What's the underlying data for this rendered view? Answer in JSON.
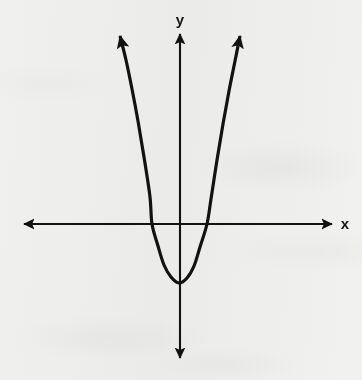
{
  "figure": {
    "kind": "cartesian-coordinate-plane",
    "title": "",
    "background_color": "#f7f7f6",
    "ink_color": "#121212",
    "width": 362,
    "height": 380
  },
  "axes": {
    "x_axis": {
      "label": "x",
      "label_x": 345,
      "label_y": 225,
      "line_y": 224,
      "start_x": 24,
      "end_x": 332,
      "arrowheads": "both",
      "stroke_width": 2.1
    },
    "y_axis": {
      "label": "y",
      "label_x": 180,
      "label_y": 19,
      "line_x": 180,
      "start_y": 34,
      "end_y": 358,
      "arrowheads": "both",
      "stroke_width": 2.1
    },
    "origin": {
      "x": 180,
      "y": 224
    },
    "grid": "off",
    "tick_labels": []
  },
  "chart_data": {
    "type": "line",
    "title": "",
    "xlabel": "x",
    "ylabel": "y",
    "grid": false,
    "legend": "none",
    "curve_name": "upward-opening parabola",
    "stroke_color": "#121212",
    "stroke_width": 3.2,
    "arrowheads": "both-ends-upward",
    "vertex_px": {
      "x": 179,
      "y": 283
    },
    "x_intercepts_px": [
      152,
      207
    ],
    "left_arm_tip_px": {
      "x": 120,
      "y": 30
    },
    "right_arm_tip_px": {
      "x": 240,
      "y": 30
    },
    "points_px": [
      {
        "x": 120,
        "y": 36
      },
      {
        "x": 126,
        "y": 60
      },
      {
        "x": 132,
        "y": 89
      },
      {
        "x": 138,
        "y": 121
      },
      {
        "x": 144,
        "y": 157
      },
      {
        "x": 150,
        "y": 197
      },
      {
        "x": 152,
        "y": 224
      },
      {
        "x": 158,
        "y": 246
      },
      {
        "x": 164,
        "y": 265
      },
      {
        "x": 171,
        "y": 277
      },
      {
        "x": 179,
        "y": 283
      },
      {
        "x": 187,
        "y": 278
      },
      {
        "x": 194,
        "y": 266
      },
      {
        "x": 200,
        "y": 247
      },
      {
        "x": 207,
        "y": 224
      },
      {
        "x": 211,
        "y": 199
      },
      {
        "x": 217,
        "y": 160
      },
      {
        "x": 223,
        "y": 124
      },
      {
        "x": 229,
        "y": 91
      },
      {
        "x": 235,
        "y": 61
      },
      {
        "x": 240,
        "y": 36
      }
    ]
  }
}
